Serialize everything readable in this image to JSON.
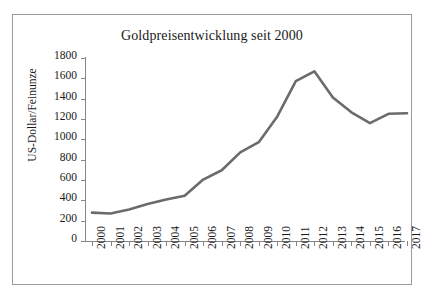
{
  "figure": {
    "title": "Goldpreisentwicklung seit 2000",
    "border_color": "#9a9a9a",
    "background": "#ffffff"
  },
  "axes": {
    "y_axis_title": "US-Dollar/Feinunze",
    "y_ticks": [
      "1800",
      "1600",
      "1400",
      "1200",
      "1000",
      "800",
      "600",
      "400",
      "200",
      "0"
    ],
    "x_ticks": [
      "2000",
      "2001",
      "2002",
      "2003",
      "2004",
      "2005",
      "2006",
      "2007",
      "2008",
      "2009",
      "2010",
      "2011",
      "2012",
      "2013",
      "2014",
      "2015",
      "2016",
      "2017"
    ],
    "axis_color": "#868686"
  },
  "series_style": {
    "line_color": "#6b6b6b",
    "line_width": 2.6
  },
  "chart_data": {
    "type": "line",
    "title": "Goldpreisentwicklung seit 2000",
    "xlabel": "",
    "ylabel": "US-Dollar/Feinunze",
    "categories": [
      "2000",
      "2001",
      "2002",
      "2003",
      "2004",
      "2005",
      "2006",
      "2007",
      "2008",
      "2009",
      "2010",
      "2011",
      "2012",
      "2013",
      "2014",
      "2015",
      "2016",
      "2017"
    ],
    "values": [
      279,
      271,
      310,
      363,
      409,
      445,
      604,
      696,
      872,
      972,
      1225,
      1572,
      1669,
      1411,
      1266,
      1160,
      1251,
      1257
    ],
    "series": [
      {
        "name": "Goldpreis",
        "values": [
          279,
          271,
          310,
          363,
          409,
          445,
          604,
          696,
          872,
          972,
          1225,
          1572,
          1669,
          1411,
          1266,
          1160,
          1251,
          1257
        ]
      }
    ],
    "ylim": [
      0,
      1800
    ],
    "ytick_step": 200,
    "grid": false,
    "legend": false,
    "markers": false
  }
}
